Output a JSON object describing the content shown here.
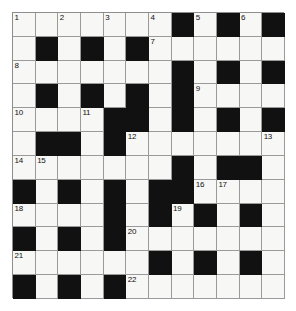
{
  "puzzle": {
    "title": "Crossword Grid",
    "rows": 12,
    "cols": 12,
    "cell_colors": {
      "white": "#f7f7f5",
      "black": "#111111",
      "grid_line": "#9a9a9a",
      "number_text": "#111111"
    },
    "clue_numbers_across": [
      1,
      7,
      8,
      9,
      10,
      12,
      14,
      16,
      18,
      19,
      20,
      21,
      22
    ],
    "clue_numbers_down": [
      1,
      2,
      3,
      4,
      5,
      6,
      11,
      13,
      15,
      17
    ],
    "grid": [
      [
        {
          "type": "white",
          "number": "1"
        },
        {
          "type": "white",
          "number": ""
        },
        {
          "type": "white",
          "number": "2"
        },
        {
          "type": "white",
          "number": ""
        },
        {
          "type": "white",
          "number": "3"
        },
        {
          "type": "white",
          "number": ""
        },
        {
          "type": "white",
          "number": "4"
        },
        {
          "type": "black",
          "number": ""
        },
        {
          "type": "white",
          "number": "5"
        },
        {
          "type": "black",
          "number": ""
        },
        {
          "type": "white",
          "number": "6"
        },
        {
          "type": "black",
          "number": ""
        }
      ],
      [
        {
          "type": "white",
          "number": ""
        },
        {
          "type": "black",
          "number": ""
        },
        {
          "type": "white",
          "number": ""
        },
        {
          "type": "black",
          "number": ""
        },
        {
          "type": "white",
          "number": ""
        },
        {
          "type": "black",
          "number": ""
        },
        {
          "type": "white",
          "number": "7"
        },
        {
          "type": "white",
          "number": ""
        },
        {
          "type": "white",
          "number": ""
        },
        {
          "type": "white",
          "number": ""
        },
        {
          "type": "white",
          "number": ""
        },
        {
          "type": "white",
          "number": ""
        }
      ],
      [
        {
          "type": "white",
          "number": "8"
        },
        {
          "type": "white",
          "number": ""
        },
        {
          "type": "white",
          "number": ""
        },
        {
          "type": "white",
          "number": ""
        },
        {
          "type": "white",
          "number": ""
        },
        {
          "type": "white",
          "number": ""
        },
        {
          "type": "white",
          "number": ""
        },
        {
          "type": "black",
          "number": ""
        },
        {
          "type": "white",
          "number": ""
        },
        {
          "type": "black",
          "number": ""
        },
        {
          "type": "white",
          "number": ""
        },
        {
          "type": "black",
          "number": ""
        }
      ],
      [
        {
          "type": "white",
          "number": ""
        },
        {
          "type": "black",
          "number": ""
        },
        {
          "type": "white",
          "number": ""
        },
        {
          "type": "black",
          "number": ""
        },
        {
          "type": "white",
          "number": ""
        },
        {
          "type": "black",
          "number": ""
        },
        {
          "type": "white",
          "number": ""
        },
        {
          "type": "black",
          "number": ""
        },
        {
          "type": "white",
          "number": "9"
        },
        {
          "type": "white",
          "number": ""
        },
        {
          "type": "white",
          "number": ""
        },
        {
          "type": "white",
          "number": ""
        }
      ],
      [
        {
          "type": "white",
          "number": "10"
        },
        {
          "type": "white",
          "number": ""
        },
        {
          "type": "white",
          "number": ""
        },
        {
          "type": "white",
          "number": "11"
        },
        {
          "type": "black",
          "number": ""
        },
        {
          "type": "black",
          "number": ""
        },
        {
          "type": "white",
          "number": ""
        },
        {
          "type": "black",
          "number": ""
        },
        {
          "type": "white",
          "number": ""
        },
        {
          "type": "black",
          "number": ""
        },
        {
          "type": "white",
          "number": ""
        },
        {
          "type": "black",
          "number": ""
        }
      ],
      [
        {
          "type": "white",
          "number": ""
        },
        {
          "type": "black",
          "number": ""
        },
        {
          "type": "black",
          "number": ""
        },
        {
          "type": "white",
          "number": ""
        },
        {
          "type": "black",
          "number": ""
        },
        {
          "type": "white",
          "number": "12"
        },
        {
          "type": "white",
          "number": ""
        },
        {
          "type": "white",
          "number": ""
        },
        {
          "type": "white",
          "number": ""
        },
        {
          "type": "white",
          "number": ""
        },
        {
          "type": "white",
          "number": ""
        },
        {
          "type": "white",
          "number": "13"
        }
      ],
      [
        {
          "type": "white",
          "number": "14"
        },
        {
          "type": "white",
          "number": "15"
        },
        {
          "type": "white",
          "number": ""
        },
        {
          "type": "white",
          "number": ""
        },
        {
          "type": "white",
          "number": ""
        },
        {
          "type": "white",
          "number": ""
        },
        {
          "type": "white",
          "number": ""
        },
        {
          "type": "black",
          "number": ""
        },
        {
          "type": "white",
          "number": ""
        },
        {
          "type": "black",
          "number": ""
        },
        {
          "type": "black",
          "number": ""
        },
        {
          "type": "white",
          "number": ""
        }
      ],
      [
        {
          "type": "black",
          "number": ""
        },
        {
          "type": "white",
          "number": ""
        },
        {
          "type": "black",
          "number": ""
        },
        {
          "type": "white",
          "number": ""
        },
        {
          "type": "black",
          "number": ""
        },
        {
          "type": "white",
          "number": ""
        },
        {
          "type": "black",
          "number": ""
        },
        {
          "type": "black",
          "number": ""
        },
        {
          "type": "white",
          "number": "16"
        },
        {
          "type": "white",
          "number": "17"
        },
        {
          "type": "white",
          "number": ""
        },
        {
          "type": "white",
          "number": ""
        }
      ],
      [
        {
          "type": "white",
          "number": "18"
        },
        {
          "type": "white",
          "number": ""
        },
        {
          "type": "white",
          "number": ""
        },
        {
          "type": "white",
          "number": ""
        },
        {
          "type": "black",
          "number": ""
        },
        {
          "type": "white",
          "number": ""
        },
        {
          "type": "black",
          "number": ""
        },
        {
          "type": "white",
          "number": "19"
        },
        {
          "type": "black",
          "number": ""
        },
        {
          "type": "white",
          "number": ""
        },
        {
          "type": "black",
          "number": ""
        },
        {
          "type": "white",
          "number": ""
        }
      ],
      [
        {
          "type": "black",
          "number": ""
        },
        {
          "type": "white",
          "number": ""
        },
        {
          "type": "black",
          "number": ""
        },
        {
          "type": "white",
          "number": ""
        },
        {
          "type": "black",
          "number": ""
        },
        {
          "type": "white",
          "number": "20"
        },
        {
          "type": "white",
          "number": ""
        },
        {
          "type": "white",
          "number": ""
        },
        {
          "type": "white",
          "number": ""
        },
        {
          "type": "white",
          "number": ""
        },
        {
          "type": "white",
          "number": ""
        },
        {
          "type": "white",
          "number": ""
        }
      ],
      [
        {
          "type": "white",
          "number": "21"
        },
        {
          "type": "white",
          "number": ""
        },
        {
          "type": "white",
          "number": ""
        },
        {
          "type": "white",
          "number": ""
        },
        {
          "type": "white",
          "number": ""
        },
        {
          "type": "white",
          "number": ""
        },
        {
          "type": "black",
          "number": ""
        },
        {
          "type": "white",
          "number": ""
        },
        {
          "type": "black",
          "number": ""
        },
        {
          "type": "white",
          "number": ""
        },
        {
          "type": "black",
          "number": ""
        },
        {
          "type": "white",
          "number": ""
        }
      ],
      [
        {
          "type": "black",
          "number": ""
        },
        {
          "type": "white",
          "number": ""
        },
        {
          "type": "black",
          "number": ""
        },
        {
          "type": "white",
          "number": ""
        },
        {
          "type": "black",
          "number": ""
        },
        {
          "type": "white",
          "number": "22"
        },
        {
          "type": "white",
          "number": ""
        },
        {
          "type": "white",
          "number": ""
        },
        {
          "type": "white",
          "number": ""
        },
        {
          "type": "white",
          "number": ""
        },
        {
          "type": "white",
          "number": ""
        },
        {
          "type": "white",
          "number": ""
        }
      ]
    ]
  }
}
